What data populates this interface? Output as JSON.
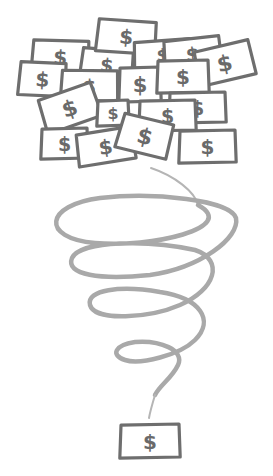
{
  "illustration": {
    "description": "Pile of dollar bills funneling through a spiral down to a single bill",
    "colors": {
      "background": "#ffffff",
      "bill_outline": "#6e6e6e",
      "bill_fill": "#ffffff",
      "dollar_sign": "#6a6a6a",
      "spiral": "#a9a9a9"
    },
    "currency_symbol": "$",
    "pile": [
      {
        "x": 33,
        "y": 40,
        "w": 55,
        "h": 33,
        "rot": 3
      },
      {
        "x": 82,
        "y": 49,
        "w": 50,
        "h": 30,
        "rot": 6
      },
      {
        "x": 98,
        "y": 20,
        "w": 57,
        "h": 32,
        "rot": 5
      },
      {
        "x": 135,
        "y": 40,
        "w": 55,
        "h": 28,
        "rot": -3
      },
      {
        "x": 165,
        "y": 38,
        "w": 55,
        "h": 30,
        "rot": -5
      },
      {
        "x": 197,
        "y": 45,
        "w": 55,
        "h": 35,
        "rot": -12
      },
      {
        "x": 20,
        "y": 62,
        "w": 45,
        "h": 33,
        "rot": 4
      },
      {
        "x": 62,
        "y": 70,
        "w": 55,
        "h": 30,
        "rot": 2
      },
      {
        "x": 120,
        "y": 67,
        "w": 40,
        "h": 34,
        "rot": 0
      },
      {
        "x": 158,
        "y": 60,
        "w": 50,
        "h": 32,
        "rot": 0
      },
      {
        "x": 42,
        "y": 90,
        "w": 55,
        "h": 35,
        "rot": -18
      },
      {
        "x": 98,
        "y": 100,
        "w": 30,
        "h": 25,
        "rot": 0
      },
      {
        "x": 170,
        "y": 92,
        "w": 55,
        "h": 30,
        "rot": 0
      },
      {
        "x": 140,
        "y": 100,
        "w": 55,
        "h": 30,
        "rot": 0
      },
      {
        "x": 42,
        "y": 128,
        "w": 45,
        "h": 30,
        "rot": 0
      },
      {
        "x": 78,
        "y": 130,
        "w": 55,
        "h": 32,
        "rot": -8
      },
      {
        "x": 120,
        "y": 118,
        "w": 50,
        "h": 35,
        "rot": 15
      },
      {
        "x": 180,
        "y": 130,
        "w": 55,
        "h": 32,
        "rot": 0
      }
    ],
    "single_bill": {
      "x": 121,
      "y": 424,
      "w": 58,
      "h": 33,
      "rot": 0
    }
  }
}
